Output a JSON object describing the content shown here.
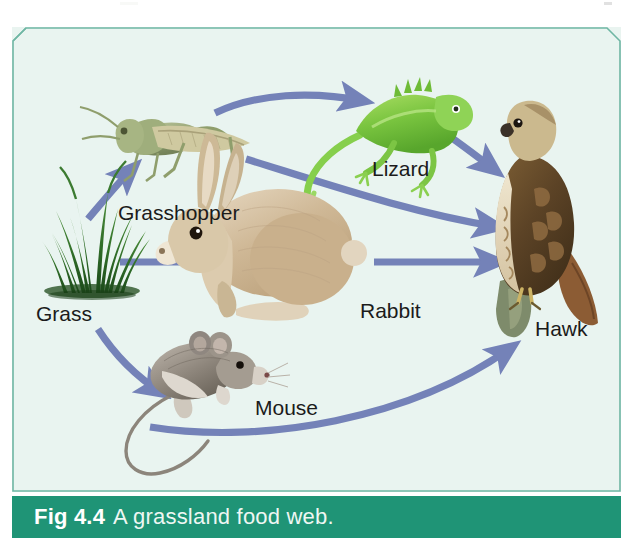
{
  "figure": {
    "caption_number": "Fig 4.4",
    "caption_text": "A grassland food web.",
    "panel_bg": "#e9f4f0",
    "panel_border": "#7fbfae",
    "caption_bar_color": "#1f9476",
    "arrow_color": "#7482b8",
    "label_color": "#1b1b1b"
  },
  "organisms": [
    {
      "id": "grass",
      "label": "Grass",
      "label_x": 38,
      "label_y": 292,
      "color": "#2f6b2a"
    },
    {
      "id": "grasshopper",
      "label": "Grasshopper",
      "label_x": 122,
      "label_y": 182,
      "color": "#9aa77a"
    },
    {
      "id": "lizard",
      "label": "Lizard",
      "label_x": 360,
      "label_y": 140,
      "color": "#7ac943"
    },
    {
      "id": "rabbit",
      "label": "Rabbit",
      "label_x": 350,
      "label_y": 282,
      "color": "#cbb08a"
    },
    {
      "id": "mouse",
      "label": "Mouse",
      "label_x": 245,
      "label_y": 378,
      "color": "#9a9188"
    },
    {
      "id": "hawk",
      "label": "Hawk",
      "label_x": 522,
      "label_y": 300,
      "color": "#6b4f2a"
    }
  ],
  "arrows": [
    {
      "id": "grass-to-grasshopper",
      "from": "Grass",
      "to": "Grasshopper"
    },
    {
      "id": "grass-to-rabbit",
      "from": "Grass",
      "to": "Rabbit"
    },
    {
      "id": "grass-to-mouse",
      "from": "Grass",
      "to": "Mouse"
    },
    {
      "id": "grasshopper-to-lizard",
      "from": "Grasshopper",
      "to": "Lizard"
    },
    {
      "id": "grasshopper-to-hawk",
      "from": "Grasshopper",
      "to": "Hawk"
    },
    {
      "id": "lizard-to-hawk",
      "from": "Lizard",
      "to": "Hawk"
    },
    {
      "id": "rabbit-to-hawk",
      "from": "Rabbit",
      "to": "Hawk"
    },
    {
      "id": "mouse-to-hawk",
      "from": "Mouse",
      "to": "Hawk"
    }
  ]
}
